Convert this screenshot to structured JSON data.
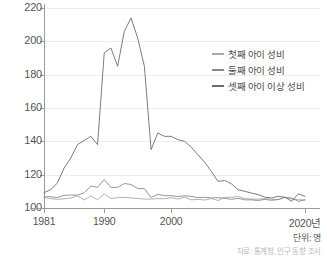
{
  "chart_data": {
    "type": "line",
    "title": "",
    "xlabel": "",
    "ylabel": "",
    "unit_note": "단위: 명",
    "source_note": "자료: 통계청, 인구 동향 조사",
    "grid": "horizontal",
    "legend_position": "right-top",
    "xlim": [
      1981,
      2020
    ],
    "ylim": [
      100,
      220
    ],
    "yticks": [
      100,
      120,
      140,
      160,
      180,
      200,
      220
    ],
    "xticks": [
      1981,
      1990,
      2000,
      2020
    ],
    "xtick_labels": [
      "1981",
      "1990",
      "2000",
      "2020년"
    ],
    "x": [
      1981,
      1982,
      1983,
      1984,
      1985,
      1986,
      1987,
      1988,
      1989,
      1990,
      1991,
      1992,
      1993,
      1994,
      1995,
      1996,
      1997,
      1998,
      1999,
      2000,
      2001,
      2002,
      2003,
      2004,
      2005,
      2006,
      2007,
      2008,
      2009,
      2010,
      2011,
      2012,
      2013,
      2014,
      2015,
      2016,
      2017,
      2018,
      2019,
      2020
    ],
    "series": [
      {
        "name": "첫째 아이 성비",
        "color": "#a8a8a8",
        "values": [
          106.3,
          105.6,
          105.2,
          105.5,
          106.0,
          107.3,
          104.8,
          107.3,
          104.9,
          108.5,
          105.7,
          106.2,
          106.4,
          106.0,
          105.8,
          105.3,
          105.4,
          105.6,
          105.6,
          106.2,
          105.4,
          106.5,
          104.9,
          105.2,
          104.8,
          105.7,
          104.5,
          106.4,
          106.4,
          106.9,
          105.7,
          105.3,
          105.3,
          105.6,
          105.3,
          105.0,
          106.4,
          105.4,
          105.0,
          104.8
        ]
      },
      {
        "name": "둘째 아이 성비",
        "color": "#8a8a8a",
        "values": [
          106.7,
          106.8,
          106.2,
          107.6,
          107.8,
          107.7,
          109.1,
          113.2,
          112.4,
          117.1,
          112.4,
          112.4,
          114.7,
          114.1,
          111.7,
          111.6,
          106.3,
          108.2,
          107.4,
          107.4,
          106.9,
          107.3,
          107.0,
          106.2,
          106.4,
          106.0,
          106.2,
          105.8,
          105.2,
          105.8,
          104.9,
          104.9,
          104.5,
          105.2,
          104.6,
          105.1,
          106.3,
          106.0,
          104.0,
          104.9
        ]
      },
      {
        "name": "셋째 아이 이상 성비",
        "color": "#6d6d6d",
        "values": [
          109.2,
          111.0,
          115.0,
          124.0,
          130.0,
          138.0,
          140.5,
          143.0,
          138.0,
          193.0,
          196.0,
          185.0,
          206.0,
          214.0,
          202.0,
          185.0,
          135.0,
          145.0,
          143.0,
          143.0,
          141.0,
          140.0,
          136.5,
          132.0,
          127.5,
          122.0,
          116.0,
          116.5,
          114.5,
          111.0,
          110.0,
          109.0,
          108.0,
          106.5,
          106.0,
          107.0,
          106.5,
          104.0,
          108.5,
          107.0
        ]
      }
    ]
  },
  "legend": {
    "items": [
      {
        "label": "첫째 아이 성비"
      },
      {
        "label": "둘째 아이 성비"
      },
      {
        "label": "셋째 아이 이상 성비"
      }
    ]
  }
}
